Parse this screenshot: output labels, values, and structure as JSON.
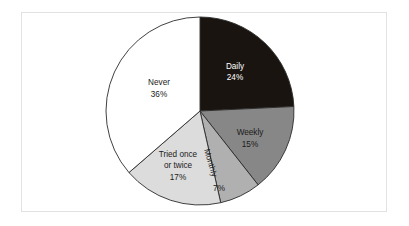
{
  "figure": {
    "frame": {
      "border_color": "#e2e2e2",
      "background": "#ffffff"
    }
  },
  "chart_data": {
    "type": "pie",
    "title": "",
    "subtitle": "",
    "xlabel": "",
    "ylabel": "",
    "legend": "none",
    "grid": false,
    "start_angle_deg": 0,
    "direction": "clockwise",
    "center": {
      "x": 200,
      "y": 111
    },
    "radius": 94,
    "categories": [
      "Daily",
      "Weekly",
      "Monthly",
      "Tried once or twice",
      "Never"
    ],
    "values": [
      24,
      15,
      7,
      17,
      36
    ],
    "value_unit": "%",
    "slice_colors": [
      "#1a1410",
      "#878787",
      "#b0b0b0",
      "#dcdcdc",
      "#ffffff"
    ],
    "slice_outline_color": "#2b2b2b",
    "slices": [
      {
        "label": "Daily",
        "value": 24,
        "value_text": "24%",
        "color": "#1a1410",
        "text_color": "#ffffff",
        "label_lines": [
          "Daily"
        ],
        "label_rotation_deg": 0,
        "label_x": 235,
        "label_y": 67,
        "value_x": 235,
        "value_y": 78
      },
      {
        "label": "Weekly",
        "value": 15,
        "value_text": "15%",
        "color": "#878787",
        "text_color": "#1a1a1a",
        "label_lines": [
          "Weekly"
        ],
        "label_rotation_deg": 0,
        "label_x": 250,
        "label_y": 133,
        "value_x": 250,
        "value_y": 145
      },
      {
        "label": "Monthly",
        "value": 7,
        "value_text": "7%",
        "color": "#b0b0b0",
        "text_color": "#1a1a1a",
        "label_lines": [
          "Monthly"
        ],
        "label_rotation_deg": 74,
        "label_x": 210,
        "label_y": 163,
        "value_x": 219,
        "value_y": 189
      },
      {
        "label": "Tried once or twice",
        "value": 17,
        "value_text": "17%",
        "color": "#dcdcdc",
        "text_color": "#1a1a1a",
        "label_lines": [
          "Tried once",
          "or twice"
        ],
        "label_rotation_deg": 0,
        "label_x": 178,
        "label_y": 155,
        "value_x": 178,
        "value_y": 178
      },
      {
        "label": "Never",
        "value": 36,
        "value_text": "36%",
        "color": "#ffffff",
        "text_color": "#1a1a1a",
        "label_lines": [
          "Never"
        ],
        "label_rotation_deg": 0,
        "label_x": 159,
        "label_y": 83,
        "value_x": 159,
        "value_y": 95
      }
    ]
  }
}
